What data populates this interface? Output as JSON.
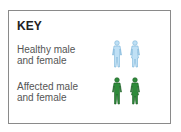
{
  "key": {
    "title": "KEY",
    "rows": [
      {
        "line1": "Healthy male",
        "line2": "and female",
        "color": "#bfe0f5",
        "stroke": "#7ab4d8"
      },
      {
        "line1": "Affected male",
        "line2": "and female",
        "color": "#2e8b3a",
        "stroke": "#1f5e26"
      }
    ]
  }
}
